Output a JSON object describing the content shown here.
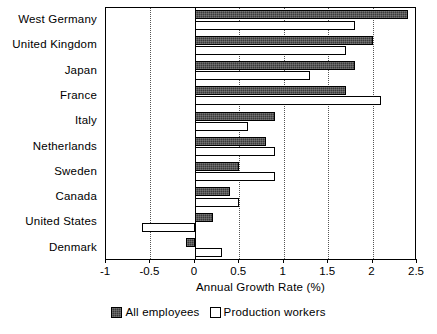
{
  "chart_data": {
    "type": "bar",
    "orientation": "horizontal",
    "title": "",
    "xlabel": "Annual Growth Rate (%)",
    "ylabel": "",
    "xlim": [
      -1,
      2.5
    ],
    "xticks": [
      -1,
      -0.5,
      0,
      0.5,
      1,
      1.5,
      2,
      2.5
    ],
    "xticklabels": [
      "-1",
      "-0.5",
      "0",
      "0.5",
      "1",
      "1.5",
      "2",
      "2.5"
    ],
    "grid": "vertical-dotted",
    "legend_position": "bottom-center",
    "categories": [
      "West Germany",
      "United Kingdom",
      "Japan",
      "France",
      "Italy",
      "Netherlands",
      "Sweden",
      "Canada",
      "United States",
      "Denmark"
    ],
    "series": [
      {
        "name": "All employees",
        "color": "#3a3a3a",
        "values": [
          2.4,
          2.0,
          1.8,
          1.7,
          0.9,
          0.8,
          0.5,
          0.4,
          0.2,
          -0.1
        ]
      },
      {
        "name": "Production workers",
        "color": "#ffffff",
        "values": [
          1.8,
          1.7,
          1.3,
          2.1,
          0.6,
          0.9,
          0.9,
          0.5,
          -0.6,
          0.3
        ]
      }
    ]
  },
  "legend": {
    "entries": [
      {
        "label": "All employees",
        "swatch": "dark"
      },
      {
        "label": "Production workers",
        "swatch": "light"
      }
    ]
  }
}
